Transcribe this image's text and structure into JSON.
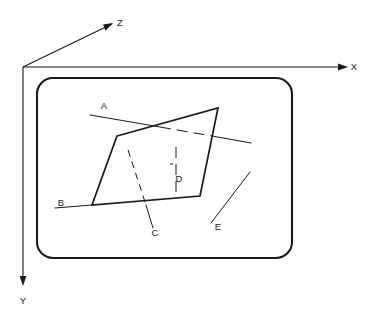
{
  "figure": {
    "kind": "technical-line-diagram",
    "background_color": "#ffffff",
    "ink_color": "#1a1a1a",
    "width": 370,
    "height": 320
  },
  "axes": {
    "origin": {
      "x": 23,
      "y": 67
    },
    "items": [
      {
        "id": "z",
        "label": "Z",
        "label_x": 120,
        "label_y": 26,
        "line": {
          "x1": 23,
          "y1": 67,
          "x2": 112,
          "y2": 24
        },
        "arrow_angle_deg": -25.8
      },
      {
        "id": "x",
        "label": "X",
        "label_x": 354,
        "label_y": 70,
        "line": {
          "x1": 23,
          "y1": 67,
          "x2": 347,
          "y2": 67
        },
        "arrow_angle_deg": 0
      },
      {
        "id": "y",
        "label": "Y",
        "label_x": 20,
        "label_y": 304,
        "line": {
          "x1": 23,
          "y1": 67,
          "x2": 23,
          "y2": 285
        },
        "arrow_angle_deg": 90
      }
    ]
  },
  "frame": {
    "name": "rounded-plane-boundary",
    "x": 37,
    "y": 78,
    "width": 255,
    "height": 180,
    "corner_radius": 16
  },
  "polygon": {
    "name": "quadrilateral-plane",
    "points": "117,136 218,108 200,196 92,205",
    "vertices": [
      {
        "x": 117,
        "y": 136
      },
      {
        "x": 218,
        "y": 108
      },
      {
        "x": 200,
        "y": 196
      },
      {
        "x": 92,
        "y": 205
      }
    ]
  },
  "lines": [
    {
      "id": "A",
      "label": "A",
      "label_x": 104,
      "label_y": 109,
      "style": "solid-dashed-solid",
      "segments": [
        {
          "style": "solid",
          "x1": 90,
          "y1": 115,
          "x2": 160,
          "y2": 127
        },
        {
          "style": "dashed",
          "x1": 160,
          "y1": 127,
          "x2": 212,
          "y2": 136
        },
        {
          "style": "solid",
          "x1": 212,
          "y1": 136,
          "x2": 251,
          "y2": 143
        }
      ]
    },
    {
      "id": "B",
      "label": "B",
      "label_x": 61,
      "label_y": 206,
      "style": "solid",
      "segments": [
        {
          "style": "solid",
          "x1": 55,
          "y1": 208,
          "x2": 92,
          "y2": 205
        }
      ]
    },
    {
      "id": "C",
      "label": "C",
      "label_x": 155,
      "label_y": 236,
      "style": "dashed-solid",
      "segments": [
        {
          "style": "dashed",
          "x1": 128,
          "y1": 150,
          "x2": 146,
          "y2": 205
        },
        {
          "style": "solid",
          "x1": 146,
          "y1": 205,
          "x2": 153,
          "y2": 228
        }
      ]
    },
    {
      "id": "D",
      "label": "D",
      "label_x": 179,
      "label_y": 182,
      "style": "dashed-vertical",
      "segments": [
        {
          "style": "dashed",
          "x1": 176,
          "y1": 147,
          "x2": 176,
          "y2": 192
        }
      ],
      "tick_mark": {
        "x1": 170,
        "y1": 164,
        "x2": 173,
        "y2": 164
      }
    },
    {
      "id": "E",
      "label": "E",
      "label_x": 218,
      "label_y": 230,
      "style": "solid",
      "segments": [
        {
          "style": "solid",
          "x1": 211,
          "y1": 223,
          "x2": 250,
          "y2": 172
        }
      ]
    }
  ]
}
